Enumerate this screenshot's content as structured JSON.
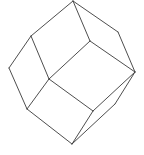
{
  "figure": {
    "shape": "rhombic-dodecahedron-wireframe",
    "stroke_color": "#3a3a3a",
    "background": "#ffffff",
    "vertices": {
      "top": [
        73,
        1
      ],
      "upper_left": [
        31,
        36
      ],
      "left": [
        9,
        68
      ],
      "lower_left": [
        27,
        109
      ],
      "bottom": [
        72,
        144
      ],
      "right": [
        135,
        72
      ],
      "upper_right": [
        118,
        32
      ],
      "inner_top": [
        90,
        41
      ],
      "center": [
        49,
        79
      ],
      "inner_bottom": [
        93,
        111
      ],
      "lower_right_inner": [
        115,
        104
      ]
    },
    "edges": [
      [
        "top",
        "upper_left"
      ],
      [
        "top",
        "inner_top"
      ],
      [
        "top",
        "upper_right"
      ],
      [
        "upper_left",
        "left"
      ],
      [
        "upper_left",
        "center"
      ],
      [
        "left",
        "lower_left"
      ],
      [
        "lower_left",
        "center"
      ],
      [
        "lower_left",
        "bottom"
      ],
      [
        "center",
        "inner_top"
      ],
      [
        "center",
        "inner_bottom"
      ],
      [
        "inner_top",
        "right"
      ],
      [
        "upper_right",
        "right"
      ],
      [
        "inner_bottom",
        "right"
      ],
      [
        "inner_bottom",
        "bottom"
      ],
      [
        "right",
        "lower_right_inner"
      ],
      [
        "lower_right_inner",
        "bottom"
      ]
    ]
  }
}
